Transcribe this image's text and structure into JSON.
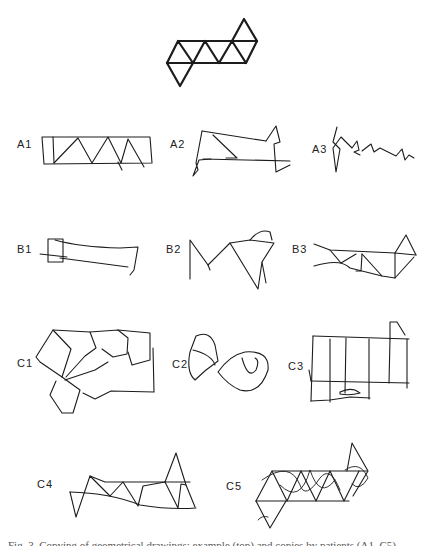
{
  "figure": {
    "model_drawing": "triangle-strip-model",
    "labels": {
      "a1": "A1",
      "a2": "A2",
      "a3": "A3",
      "b1": "B1",
      "b2": "B2",
      "b3": "B3",
      "c1": "C1",
      "c2": "C2",
      "c3": "C3",
      "c4": "C4",
      "c5": "C5"
    },
    "caption": "Fig. 3. Copying of geometrical drawings: example (top) and copies by patients (A1–C5)"
  }
}
